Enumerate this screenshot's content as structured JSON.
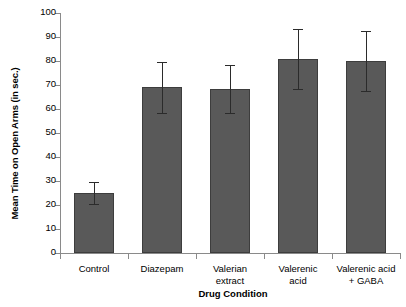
{
  "chart_data": {
    "type": "bar",
    "title": "",
    "xlabel": "Drug Condition",
    "ylabel": "Mean Time on Open Arms (in sec.)",
    "categories": [
      "Control",
      "Diazepam",
      "Valerian\nextract",
      "Valerenic\nacid",
      "Valerenic acid\n+ GABA"
    ],
    "values": [
      25,
      69,
      68.5,
      81,
      80
    ],
    "errors": [
      4.5,
      10.5,
      10,
      12.5,
      12.5
    ],
    "ylim": [
      0,
      100
    ],
    "yticks": [
      0,
      10,
      20,
      30,
      40,
      50,
      60,
      70,
      80,
      90,
      100
    ],
    "ytick_labels": [
      "0",
      "10",
      "20",
      "30",
      "40",
      "50",
      "60",
      "70",
      "80",
      "90",
      "100"
    ],
    "grid": false,
    "legend": null,
    "bar_color": "#595959",
    "bar_edge_color": "#3d3d3d",
    "error_color": "#2b2b2b",
    "axis_color": "#8a8a8a",
    "background": "#ffffff"
  }
}
